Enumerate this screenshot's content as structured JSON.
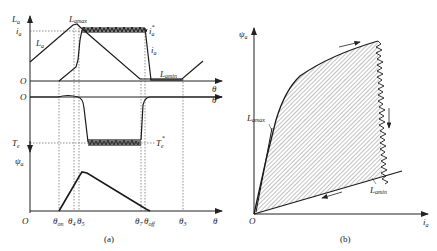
{
  "figure": {
    "panel_a": {
      "caption": "(a)",
      "top_plot": {
        "y_label": "L",
        "y_label_sub": "a",
        "current_level_label": "i",
        "current_level_sub": "a",
        "inductance_trace_label": "L",
        "inductance_trace_sub": "a",
        "lmax_label": "L",
        "lmax_sub": "amax",
        "lmin_label": "L",
        "lmin_sub": "amin",
        "ref_current_label": "i",
        "ref_current_sub": "a",
        "ref_current_sup": "*",
        "current_trace_label": "i",
        "current_trace_sub": "a",
        "origin": "O",
        "x_label": "θ"
      },
      "torque_plot": {
        "origin": "O",
        "x_label": "θ",
        "y_label": "T",
        "y_label_sub": "e",
        "ref_torque_label": "T",
        "ref_torque_sub": "e",
        "ref_torque_sup": "*"
      },
      "flux_plot": {
        "y_label": "ψ",
        "y_label_sub": "a",
        "origin": "O",
        "x_label": "θ",
        "angle_ticks": [
          {
            "main": "θ",
            "sub": "on"
          },
          {
            "main": "θ",
            "sub": "4"
          },
          {
            "main": "θ",
            "sub": "5"
          },
          {
            "main": "θ",
            "sub": "7"
          },
          {
            "main": "θ",
            "sub": "off"
          },
          {
            "main": "θ",
            "sub": "3"
          }
        ]
      }
    },
    "panel_b": {
      "caption": "(b)",
      "y_label": "ψ",
      "y_label_sub": "a",
      "x_label": "i",
      "x_label_sub": "a",
      "origin": "O",
      "lmax_label": "L",
      "lmax_sub": "amax",
      "lmin_label": "L",
      "lmin_sub": "amin"
    }
  },
  "colors": {
    "line": "#1a1a1a",
    "hatch": "#555555",
    "dotted": "#444444"
  }
}
